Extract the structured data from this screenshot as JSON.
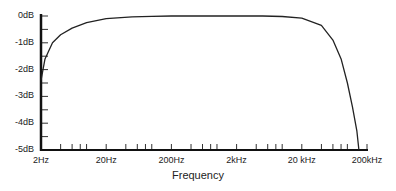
{
  "chart_data": {
    "type": "line",
    "title": "",
    "xlabel": "Frequency",
    "ylabel": "",
    "x_scale": "log",
    "x_tick_labels": [
      "2Hz",
      "20Hz",
      "200Hz",
      "2kHz",
      "20 kHz",
      "200kHz"
    ],
    "x_tick_values": [
      2,
      20,
      200,
      2000,
      20000,
      200000
    ],
    "y_tick_labels": [
      "0dB",
      "-1dB",
      "-2dB",
      "-3dB",
      "-4dB",
      "-5dB"
    ],
    "y_tick_values": [
      0,
      -1,
      -2,
      -3,
      -4,
      -5
    ],
    "xlim": [
      2,
      200000
    ],
    "ylim": [
      -5,
      0
    ],
    "grid": false,
    "legend": null,
    "series": [
      {
        "name": "Frequency response",
        "x": [
          2,
          2.3,
          3,
          4,
          6,
          10,
          20,
          50,
          100,
          200,
          1000,
          5000,
          10000,
          20000,
          40000,
          60000,
          80000,
          100000,
          120000,
          140000,
          150000
        ],
        "y": [
          -2.4,
          -1.6,
          -1.0,
          -0.7,
          -0.45,
          -0.25,
          -0.1,
          -0.03,
          -0.01,
          0,
          0,
          0,
          -0.02,
          -0.08,
          -0.35,
          -0.9,
          -1.6,
          -2.5,
          -3.4,
          -4.3,
          -5.0
        ]
      }
    ],
    "colors": {
      "line": "#222222",
      "axis": "#111111"
    }
  }
}
